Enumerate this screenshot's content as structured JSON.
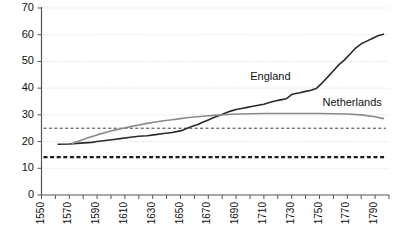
{
  "chart_data": {
    "type": "line",
    "title": "",
    "xlabel": "",
    "ylabel": "",
    "xlim": [
      1550,
      1800
    ],
    "ylim": [
      0,
      70
    ],
    "yticks": [
      0,
      10,
      20,
      30,
      40,
      50,
      60,
      70
    ],
    "xticks": [
      1550,
      1560,
      1570,
      1580,
      1590,
      1600,
      1610,
      1620,
      1630,
      1640,
      1650,
      1660,
      1670,
      1680,
      1690,
      1700,
      1710,
      1720,
      1730,
      1740,
      1750,
      1760,
      1770,
      1780,
      1790,
      1800
    ],
    "xtick_labels": [
      "1550",
      "1570",
      "1590",
      "1610",
      "1630",
      "1650",
      "1670",
      "1690",
      "1710",
      "1730",
      "1750",
      "1770",
      "1790"
    ],
    "xtick_label_values": [
      1550,
      1570,
      1590,
      1610,
      1630,
      1650,
      1670,
      1690,
      1710,
      1730,
      1750,
      1770,
      1790
    ],
    "grid": true,
    "grid_axis": "y",
    "legend": "inline-annotations",
    "series": [
      {
        "name": "England",
        "color": "#2b2b2b",
        "style": "solid",
        "width": 1.6,
        "x": [
          1562,
          1570,
          1578,
          1586,
          1590,
          1596,
          1602,
          1608,
          1614,
          1620,
          1626,
          1632,
          1638,
          1644,
          1650,
          1654,
          1658,
          1662,
          1666,
          1670,
          1674,
          1678,
          1682,
          1686,
          1690,
          1694,
          1698,
          1702,
          1706,
          1710,
          1714,
          1718,
          1722,
          1726,
          1730,
          1732,
          1736,
          1740,
          1744,
          1748,
          1752,
          1756,
          1760,
          1764,
          1768,
          1772,
          1776,
          1780,
          1784,
          1788,
          1792,
          1796
        ],
        "y": [
          19.0,
          19.1,
          19.4,
          19.7,
          20.0,
          20.4,
          20.8,
          21.2,
          21.6,
          22.0,
          22.2,
          22.6,
          23.0,
          23.4,
          24.0,
          24.8,
          25.6,
          26.3,
          27.2,
          28.1,
          29.0,
          29.8,
          30.6,
          31.4,
          32.0,
          32.4,
          32.8,
          33.2,
          33.6,
          34.0,
          34.6,
          35.2,
          35.6,
          36.0,
          37.6,
          37.9,
          38.3,
          38.8,
          39.2,
          40.0,
          42.0,
          44.2,
          46.5,
          48.8,
          50.6,
          52.8,
          55.0,
          56.6,
          57.6,
          58.6,
          59.6,
          60.2
        ],
        "label_text": "England"
      },
      {
        "name": "Netherlands",
        "color": "#8a8a8a",
        "style": "solid",
        "width": 1.6,
        "x": [
          1572,
          1578,
          1584,
          1590,
          1596,
          1602,
          1608,
          1614,
          1620,
          1626,
          1632,
          1638,
          1644,
          1650,
          1656,
          1662,
          1668,
          1674,
          1680,
          1686,
          1692,
          1700,
          1710,
          1720,
          1730,
          1740,
          1750,
          1760,
          1770,
          1780,
          1790,
          1796
        ],
        "y": [
          19.3,
          20.4,
          21.5,
          22.5,
          23.4,
          24.2,
          24.9,
          25.6,
          26.2,
          26.8,
          27.3,
          27.8,
          28.2,
          28.6,
          29.0,
          29.3,
          29.6,
          29.8,
          30.0,
          30.2,
          30.3,
          30.4,
          30.5,
          30.5,
          30.5,
          30.5,
          30.5,
          30.4,
          30.3,
          30.0,
          29.3,
          28.6
        ],
        "label_text": "Netherlands"
      }
    ],
    "reference_lines": [
      {
        "name": "upper-reference",
        "value": 25.0,
        "style": "dashed",
        "color": "#3a3a3a",
        "width": 1.0
      },
      {
        "name": "lower-reference",
        "value": 14.2,
        "style": "dashed",
        "color": "#1a1a1a",
        "width": 2.2
      }
    ],
    "annotations": [
      {
        "name": "england-label",
        "text": "England",
        "x": 1716,
        "y": 44.0
      },
      {
        "name": "netherlands-label",
        "text": "Netherlands",
        "x": 1768,
        "y": 34.5
      }
    ]
  }
}
